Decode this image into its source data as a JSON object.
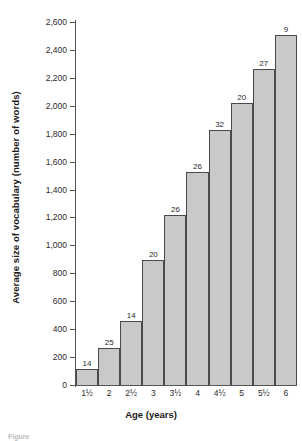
{
  "figure": {
    "caption_fragment": "Figure"
  },
  "chart_data": {
    "type": "bar",
    "title": "",
    "xlabel": "Age (years)",
    "ylabel": "Average size of vocabulary (number of words)",
    "categories": [
      "1½",
      "2",
      "2½",
      "3",
      "3½",
      "4",
      "4½",
      "5",
      "5½",
      "6"
    ],
    "values": [
      115,
      265,
      455,
      895,
      1215,
      1525,
      1830,
      2020,
      2265,
      2510
    ],
    "point_labels": [
      "14",
      "25",
      "14",
      "20",
      "26",
      "26",
      "32",
      "20",
      "27",
      "9"
    ],
    "ylim": [
      0,
      2600
    ],
    "yticks": [
      0,
      200,
      400,
      600,
      800,
      1000,
      1200,
      1400,
      1600,
      1800,
      2000,
      2200,
      2400,
      2600
    ],
    "ytick_labels": [
      "0",
      "200",
      "400",
      "600",
      "800",
      "1,000",
      "1,200",
      "1,400",
      "1,600",
      "1,800",
      "2,000",
      "2,200",
      "2,400",
      "2,600"
    ],
    "grid": false,
    "legend": null,
    "bar_color": "#c9c9c9",
    "bar_border_color": "#4a4a4a",
    "axis_color": "#555555"
  }
}
